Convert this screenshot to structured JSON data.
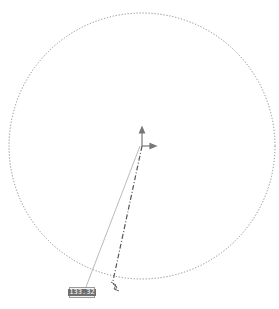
{
  "canvas": {
    "width": 279,
    "height": 309,
    "background": "#ffffff"
  },
  "circle": {
    "cx": 142,
    "cy": 146,
    "r": 133,
    "stroke": "#8a8a8a",
    "style": "dotted"
  },
  "origin_axes": {
    "x": 142,
    "y": 146,
    "color": "#7a7a7a"
  },
  "radius_line": {
    "x1": 142,
    "y1": 146,
    "x2": 113,
    "y2": 281,
    "style": "dash-dot",
    "color": "#5a5a5a"
  },
  "leader_line": {
    "x1": 140,
    "y1": 146,
    "x2": 86,
    "y2": 287,
    "color": "#a0a0a0"
  },
  "dimension": {
    "value": "133.32"
  },
  "cursor": {
    "x": 115,
    "y": 285,
    "icon": "drag-handle-icon"
  }
}
